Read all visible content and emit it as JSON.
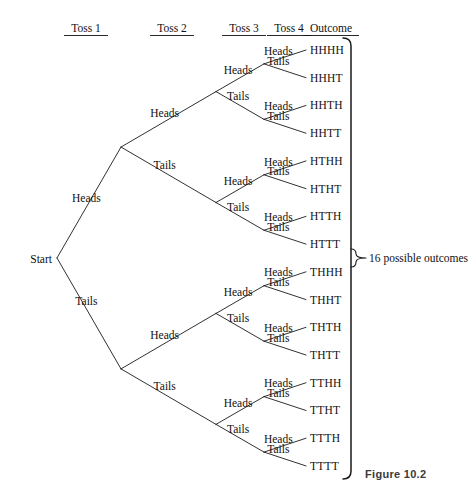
{
  "figure": {
    "caption": "Figure 10.2",
    "caption_x": 365,
    "caption_y": 468
  },
  "headers": [
    {
      "label": "Toss 1",
      "x": 86,
      "y": 32,
      "rule_half_width": 22
    },
    {
      "label": "Toss 2",
      "x": 172,
      "y": 32,
      "rule_half_width": 22
    },
    {
      "label": "Toss 3",
      "x": 244,
      "y": 32,
      "rule_half_width": 22
    },
    {
      "label": "Toss 4",
      "x": 289,
      "y": 32,
      "rule_half_width": 22
    },
    {
      "label": "Outcome",
      "x": 331,
      "y": 32,
      "rule_half_width": 28
    }
  ],
  "start": {
    "label": "Start",
    "label_x": 52,
    "label_y": 263,
    "node_x": 57,
    "node_y": 259
  },
  "labels": {
    "heads": "Heads",
    "tails": "Tails"
  },
  "geometry": {
    "level_x": [
      57,
      121,
      216,
      264,
      306
    ],
    "outcome_text_x": 310,
    "outcome_top_y": 50,
    "outcome_step": 27.73,
    "bracket_x": 351,
    "bracket_top": 38,
    "bracket_bottom": 479,
    "bracket_lip": 8,
    "pointer_x": 356,
    "pointer_tip_x": 366,
    "pointer_y": 258
  },
  "summary": {
    "text": "16 possible outcomes",
    "x": 369,
    "y": 262
  },
  "chart_data": {
    "type": "tree",
    "levels": 4,
    "level_names": [
      "Toss 1",
      "Toss 2",
      "Toss 3",
      "Toss 4"
    ],
    "branch_labels": [
      "Heads",
      "Tails"
    ],
    "root_label": "Start",
    "total_outcomes": 16,
    "outcomes": [
      "HHHH",
      "HHHT",
      "HHTH",
      "HHTT",
      "HTHH",
      "HTHT",
      "HTTH",
      "HTTT",
      "THHH",
      "THHT",
      "THTH",
      "THTT",
      "TTHH",
      "TTHT",
      "TTTH",
      "TTTT"
    ],
    "note": "16 possible outcomes"
  }
}
